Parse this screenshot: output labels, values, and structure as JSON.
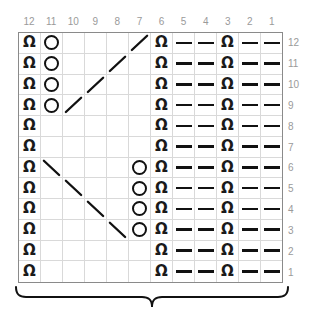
{
  "chart_data": {
    "type": "table",
    "title": "",
    "subtitle": "",
    "xlabel": "",
    "ylabel": "",
    "columns": 12,
    "rows": 12,
    "column_labels": [
      "12",
      "11",
      "10",
      "9",
      "8",
      "7",
      "6",
      "5",
      "4",
      "3",
      "2",
      "1"
    ],
    "row_labels": [
      "12",
      "11",
      "10",
      "9",
      "8",
      "7",
      "6",
      "5",
      "4",
      "3",
      "2",
      "1"
    ],
    "legend": [],
    "symbol_key": {
      "purl": "purl-stitch",
      "circle": "yarn-over",
      "dash": "horizontal-dash",
      "diag-up": "diagonal-rising-line",
      "diag-down": "diagonal-falling-line",
      "empty": "blank-cell"
    },
    "grid": true,
    "cells": [
      [
        "purl",
        "circle",
        "empty",
        "empty",
        "empty",
        "diag-up",
        "purl",
        "dash",
        "dash",
        "purl",
        "dash",
        "dash"
      ],
      [
        "purl",
        "circle",
        "empty",
        "empty",
        "diag-up",
        "empty",
        "purl",
        "dash",
        "dash",
        "purl",
        "dash",
        "dash"
      ],
      [
        "purl",
        "circle",
        "empty",
        "diag-up",
        "empty",
        "empty",
        "purl",
        "dash",
        "dash",
        "purl",
        "dash",
        "dash"
      ],
      [
        "purl",
        "circle",
        "diag-up",
        "empty",
        "empty",
        "empty",
        "purl",
        "dash",
        "dash",
        "purl",
        "dash",
        "dash"
      ],
      [
        "purl",
        "empty",
        "empty",
        "empty",
        "empty",
        "empty",
        "purl",
        "dash",
        "dash",
        "purl",
        "dash",
        "dash"
      ],
      [
        "purl",
        "empty",
        "empty",
        "empty",
        "empty",
        "empty",
        "purl",
        "dash",
        "dash",
        "purl",
        "dash",
        "dash"
      ],
      [
        "purl",
        "diag-down",
        "empty",
        "empty",
        "empty",
        "circle",
        "purl",
        "dash",
        "dash",
        "purl",
        "dash",
        "dash"
      ],
      [
        "purl",
        "empty",
        "diag-down",
        "empty",
        "empty",
        "circle",
        "purl",
        "dash",
        "dash",
        "purl",
        "dash",
        "dash"
      ],
      [
        "purl",
        "empty",
        "empty",
        "diag-down",
        "empty",
        "circle",
        "purl",
        "dash",
        "dash",
        "purl",
        "dash",
        "dash"
      ],
      [
        "purl",
        "empty",
        "empty",
        "empty",
        "diag-down",
        "circle",
        "purl",
        "dash",
        "dash",
        "purl",
        "dash",
        "dash"
      ],
      [
        "purl",
        "empty",
        "empty",
        "empty",
        "empty",
        "empty",
        "purl",
        "dash",
        "dash",
        "purl",
        "dash",
        "dash"
      ],
      [
        "purl",
        "empty",
        "empty",
        "empty",
        "empty",
        "empty",
        "purl",
        "dash",
        "dash",
        "purl",
        "dash",
        "dash"
      ]
    ],
    "annotations": [
      {
        "name": "bottom-brace",
        "text": "",
        "position": "below-grid"
      }
    ],
    "colors": {
      "grid_line": "#d9d9d9",
      "grid_border": "#8a8a8a",
      "symbol": "#111111",
      "label": "#9a9a9a",
      "background": "#ffffff"
    },
    "purl_glyph": "Ω"
  }
}
